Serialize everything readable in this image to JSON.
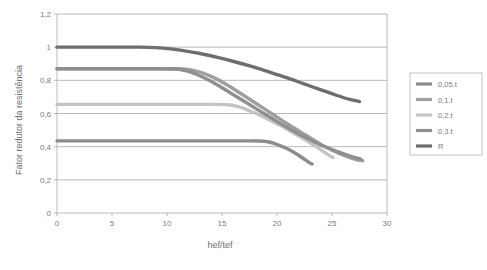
{
  "chart_data": {
    "type": "line",
    "title": "",
    "xlabel": "hef/tef",
    "ylabel": "Fator redutor da resistência",
    "xlim": [
      0,
      30
    ],
    "ylim": [
      0,
      1.2
    ],
    "xticks": [
      "0",
      "5",
      "10",
      "15",
      "20",
      "25",
      "30"
    ],
    "xtick_values": [
      0,
      5,
      10,
      15,
      20,
      25,
      30
    ],
    "yticks": [
      "0",
      "0,2",
      "0,4",
      "0,6",
      "0,8",
      "1",
      "1,2"
    ],
    "ytick_values": [
      0,
      0.2,
      0.4,
      0.6,
      0.8,
      1.0,
      1.2
    ],
    "grid": "horizontal",
    "legend_position": "right",
    "decimal_separator": ",",
    "series": [
      {
        "name": "0,05.t",
        "color": "#8c8c8c",
        "plateau_value": 0.435,
        "points": [
          {
            "x": 0,
            "y": 0.435
          },
          {
            "x": 5,
            "y": 0.435
          },
          {
            "x": 10,
            "y": 0.435
          },
          {
            "x": 15,
            "y": 0.435
          },
          {
            "x": 17,
            "y": 0.435
          },
          {
            "x": 18.5,
            "y": 0.434
          },
          {
            "x": 19.3,
            "y": 0.428
          },
          {
            "x": 20,
            "y": 0.413
          },
          {
            "x": 20.8,
            "y": 0.392
          },
          {
            "x": 21.6,
            "y": 0.363
          },
          {
            "x": 22.3,
            "y": 0.333
          },
          {
            "x": 22.9,
            "y": 0.305
          },
          {
            "x": 23.2,
            "y": 0.295
          }
        ]
      },
      {
        "name": "0,1.t",
        "color": "#9e9e9e",
        "plateau_value": 0.87,
        "points": [
          {
            "x": 0,
            "y": 0.87
          },
          {
            "x": 5,
            "y": 0.87
          },
          {
            "x": 10,
            "y": 0.87
          },
          {
            "x": 11.5,
            "y": 0.869
          },
          {
            "x": 12.3,
            "y": 0.862
          },
          {
            "x": 13.2,
            "y": 0.845
          },
          {
            "x": 14.3,
            "y": 0.815
          },
          {
            "x": 15.4,
            "y": 0.775
          },
          {
            "x": 16.6,
            "y": 0.725
          },
          {
            "x": 18,
            "y": 0.665
          },
          {
            "x": 19.5,
            "y": 0.6
          },
          {
            "x": 21,
            "y": 0.535
          },
          {
            "x": 22.6,
            "y": 0.47
          },
          {
            "x": 24.2,
            "y": 0.405
          },
          {
            "x": 25.8,
            "y": 0.355
          },
          {
            "x": 27.2,
            "y": 0.322
          },
          {
            "x": 27.8,
            "y": 0.315
          }
        ]
      },
      {
        "name": "0,2.t",
        "color": "#c4c4c4",
        "plateau_value": 0.655,
        "points": [
          {
            "x": 0,
            "y": 0.655
          },
          {
            "x": 5,
            "y": 0.655
          },
          {
            "x": 10,
            "y": 0.655
          },
          {
            "x": 14,
            "y": 0.655
          },
          {
            "x": 15.5,
            "y": 0.653
          },
          {
            "x": 16.3,
            "y": 0.645
          },
          {
            "x": 17.1,
            "y": 0.628
          },
          {
            "x": 18,
            "y": 0.603
          },
          {
            "x": 19,
            "y": 0.572
          },
          {
            "x": 20.1,
            "y": 0.535
          },
          {
            "x": 21.2,
            "y": 0.495
          },
          {
            "x": 22.3,
            "y": 0.452
          },
          {
            "x": 23.3,
            "y": 0.412
          },
          {
            "x": 24.2,
            "y": 0.372
          },
          {
            "x": 24.8,
            "y": 0.345
          },
          {
            "x": 25.1,
            "y": 0.335
          }
        ]
      },
      {
        "name": "0,3.t",
        "color": "#8f8f8f",
        "plateau_value": 0.87,
        "points": [
          {
            "x": 0,
            "y": 0.87
          },
          {
            "x": 5,
            "y": 0.87
          },
          {
            "x": 9,
            "y": 0.87
          },
          {
            "x": 10.8,
            "y": 0.868
          },
          {
            "x": 11.7,
            "y": 0.858
          },
          {
            "x": 12.6,
            "y": 0.838
          },
          {
            "x": 13.6,
            "y": 0.808
          },
          {
            "x": 14.6,
            "y": 0.772
          },
          {
            "x": 15.7,
            "y": 0.727
          },
          {
            "x": 16.9,
            "y": 0.678
          },
          {
            "x": 18.2,
            "y": 0.625
          },
          {
            "x": 19.6,
            "y": 0.568
          },
          {
            "x": 21,
            "y": 0.513
          },
          {
            "x": 22.5,
            "y": 0.458
          },
          {
            "x": 24,
            "y": 0.41
          },
          {
            "x": 25.5,
            "y": 0.37
          },
          {
            "x": 26.8,
            "y": 0.34
          },
          {
            "x": 27.6,
            "y": 0.325
          }
        ]
      },
      {
        "name": "R",
        "color": "#6e6e6e",
        "plateau_value": 1.0,
        "points": [
          {
            "x": 0,
            "y": 1.0
          },
          {
            "x": 5,
            "y": 1.0
          },
          {
            "x": 7.5,
            "y": 1.0
          },
          {
            "x": 9,
            "y": 0.997
          },
          {
            "x": 10.3,
            "y": 0.99
          },
          {
            "x": 11.6,
            "y": 0.978
          },
          {
            "x": 13,
            "y": 0.962
          },
          {
            "x": 14.5,
            "y": 0.94
          },
          {
            "x": 16,
            "y": 0.915
          },
          {
            "x": 17.6,
            "y": 0.885
          },
          {
            "x": 19.2,
            "y": 0.852
          },
          {
            "x": 20.8,
            "y": 0.818
          },
          {
            "x": 22.4,
            "y": 0.78
          },
          {
            "x": 24,
            "y": 0.742
          },
          {
            "x": 25.4,
            "y": 0.71
          },
          {
            "x": 26.6,
            "y": 0.685
          },
          {
            "x": 27.5,
            "y": 0.672
          }
        ]
      }
    ]
  }
}
